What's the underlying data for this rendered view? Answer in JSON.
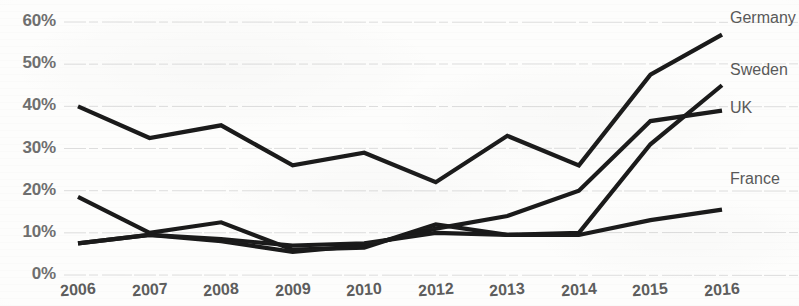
{
  "chart_data": {
    "type": "line",
    "title": "",
    "subtitle": "",
    "xlabel": "",
    "ylabel": "",
    "x": [
      "2006",
      "2007",
      "2008",
      "2009",
      "2010",
      "2012",
      "2013",
      "2014",
      "2015",
      "2016"
    ],
    "categories": [
      "2006",
      "2007",
      "2008",
      "2009",
      "2010",
      "2012",
      "2013",
      "2014",
      "2015",
      "2016"
    ],
    "ylim": [
      0,
      60
    ],
    "ytick_values": [
      0,
      10,
      20,
      30,
      40,
      50,
      60
    ],
    "ytick_labels": [
      "0%",
      "10%",
      "20%",
      "30%",
      "40%",
      "50%",
      "60%"
    ],
    "grid": true,
    "grid_axis": "y",
    "legend_position": "right-inline-end-of-line",
    "value_unit": "%",
    "series": [
      {
        "name": "Germany",
        "label": "Germany",
        "color": "#1a1a1a",
        "values": [
          40.0,
          32.5,
          35.5,
          26.0,
          29.0,
          22.0,
          33.0,
          26.0,
          47.5,
          57.0
        ]
      },
      {
        "name": "Sweden",
        "label": "Sweden",
        "color": "#1a1a1a",
        "values": [
          18.5,
          10.0,
          12.5,
          6.0,
          6.5,
          12.0,
          9.5,
          10.0,
          31.0,
          45.0
        ]
      },
      {
        "name": "UK",
        "label": "UK",
        "color": "#1a1a1a",
        "values": [
          7.5,
          9.5,
          8.0,
          5.5,
          7.0,
          11.0,
          14.0,
          20.0,
          36.5,
          39.0
        ]
      },
      {
        "name": "France",
        "label": "France",
        "color": "#1a1a1a",
        "values": [
          7.5,
          9.5,
          8.5,
          7.0,
          7.5,
          10.0,
          9.5,
          9.5,
          13.0,
          15.5
        ]
      }
    ]
  },
  "axis": {
    "y_labels": [
      "60%",
      "50%",
      "40%",
      "30%",
      "20%",
      "10%",
      "0%"
    ],
    "x_labels": [
      "2006",
      "2007",
      "2008",
      "2009",
      "2010",
      "2012",
      "2013",
      "2014",
      "2015",
      "2016"
    ]
  },
  "series_labels": {
    "germany": "Germany",
    "sweden": "Sweden",
    "uk": "UK",
    "france": "France"
  },
  "style": {
    "line_color": "#1a1a1a",
    "grid_color": "#d8d8d8",
    "tick_text_color": "#5d5d5d",
    "legend_text_color": "#595959",
    "background": "#fdfdfc"
  }
}
